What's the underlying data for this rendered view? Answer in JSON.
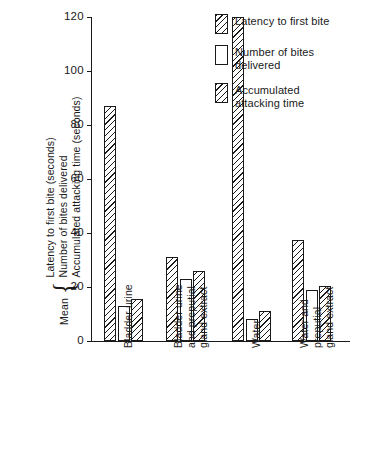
{
  "chart_data": {
    "type": "bar",
    "title": "",
    "xlabel": "",
    "ylabel_lines": [
      "Latency to first bite (seconds)",
      "Number of bites delivered",
      "Accumulated attacking time (seconds)"
    ],
    "ylabel_prefix": "Mean",
    "ylabel_brace": "{",
    "ylim": [
      0,
      120
    ],
    "yticks": [
      0,
      20,
      40,
      60,
      80,
      100,
      120
    ],
    "ytick_labels": [
      "0",
      "20",
      "40",
      "60",
      "80",
      "100",
      "120"
    ],
    "grid": false,
    "legend_position": "top-right",
    "categories": [
      "Bladder urine",
      "Bladder urine and preputial gland extract",
      "Water",
      "Water and preputial gland extract"
    ],
    "category_label_lines": [
      [
        "Bladder urine"
      ],
      [
        "Bladder urine",
        "and preputial",
        "gland extract"
      ],
      [
        "Water"
      ],
      [
        "Water and",
        "preputial",
        "gland extract"
      ]
    ],
    "series": [
      {
        "name": "Latency to first bite",
        "fill": "hatched",
        "values": [
          87,
          31,
          120,
          37.5
        ]
      },
      {
        "name": "Number of bites delivered",
        "fill": "open",
        "values": [
          13,
          23,
          8,
          19
        ]
      },
      {
        "name": "Accumulated attacking time",
        "fill": "hatched",
        "values": [
          15.5,
          26,
          11,
          20.5
        ]
      }
    ]
  },
  "legend": {
    "items": [
      {
        "label_lines": [
          "Latency to first bite"
        ],
        "fill": "hatched"
      },
      {
        "label_lines": [
          "Number of bites",
          "delivered"
        ],
        "fill": "open"
      },
      {
        "label_lines": [
          "Accumulated",
          "attacking time"
        ],
        "fill": "hatched"
      }
    ]
  },
  "colors": {
    "ink": "#1a1a1a",
    "background": "#ffffff"
  }
}
